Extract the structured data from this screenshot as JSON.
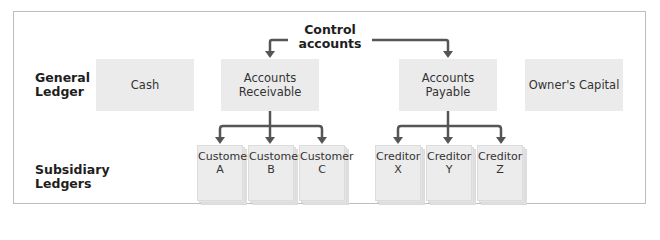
{
  "diagram": {
    "title": "Control accounts",
    "control_label_line1": "Control",
    "control_label_line2": "accounts",
    "rows": {
      "general_ledger": {
        "line1": "General",
        "line2": "Ledger"
      },
      "subsidiary_ledgers": {
        "line1": "Subsidiary",
        "line2": "Ledgers"
      }
    },
    "general_ledger_accounts": [
      {
        "line1": "Cash",
        "line2": ""
      },
      {
        "line1": "Accounts",
        "line2": "Receivable"
      },
      {
        "line1": "Accounts",
        "line2": "Payable"
      },
      {
        "line1": "Owner's Capital",
        "line2": ""
      }
    ],
    "subsidiary_accounts_receivable": [
      {
        "line1": "Customer",
        "line2": "A"
      },
      {
        "line1": "Customer",
        "line2": "B"
      },
      {
        "line1": "Customer",
        "line2": "C"
      }
    ],
    "subsidiary_accounts_payable": [
      {
        "line1": "Creditor",
        "line2": "X"
      },
      {
        "line1": "Creditor",
        "line2": "Y"
      },
      {
        "line1": "Creditor",
        "line2": "Z"
      }
    ],
    "colors": {
      "box_fill": "#ebebeb",
      "arrow": "#555555",
      "frame": "#bdbdbd"
    }
  }
}
